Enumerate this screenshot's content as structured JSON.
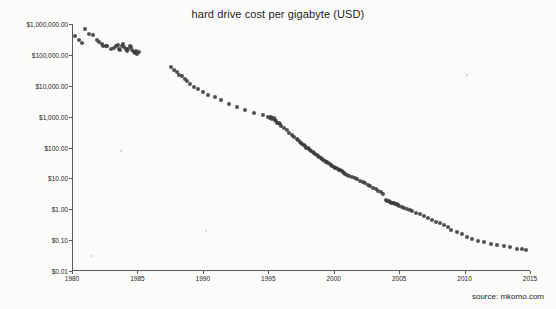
{
  "chart_data": {
    "type": "scatter",
    "title": "hard drive cost per gigabyte (USD)",
    "xlabel": "",
    "ylabel": "",
    "xlim": [
      1980,
      2015
    ],
    "ylim": [
      0.01,
      1000000
    ],
    "yscale": "log",
    "grid": false,
    "legend": null,
    "xticks": [
      1980,
      1985,
      1990,
      1995,
      2000,
      2005,
      2010,
      2015
    ],
    "yticks": [
      0.01,
      0.1,
      1,
      10,
      100,
      1000,
      10000,
      100000,
      1000000
    ],
    "ytick_labels": [
      "$0.01",
      "$0.10",
      "$1.00",
      "$10.00",
      "$100.00",
      "$1,000.00",
      "$10,000.00",
      "$100,000.00",
      "$1,000,000.00"
    ],
    "annotations": [
      {
        "text": "source: mkomo.com",
        "position": "bottom-right"
      }
    ],
    "points": [
      [
        1980.2,
        400000
      ],
      [
        1980.5,
        300000
      ],
      [
        1980.8,
        250000
      ],
      [
        1981.0,
        700000
      ],
      [
        1981.3,
        480000
      ],
      [
        1981.6,
        430000
      ],
      [
        1981.9,
        300000
      ],
      [
        1982.1,
        260000
      ],
      [
        1982.3,
        230000
      ],
      [
        1982.4,
        200000
      ],
      [
        1982.6,
        200000
      ],
      [
        1982.7,
        195000
      ],
      [
        1983.0,
        150000
      ],
      [
        1983.2,
        170000
      ],
      [
        1983.4,
        200000
      ],
      [
        1983.5,
        210000
      ],
      [
        1983.6,
        160000
      ],
      [
        1983.7,
        140000
      ],
      [
        1983.8,
        190000
      ],
      [
        1983.9,
        220000
      ],
      [
        1984.0,
        180000
      ],
      [
        1984.1,
        150000
      ],
      [
        1984.2,
        130000
      ],
      [
        1984.3,
        160000
      ],
      [
        1984.4,
        200000
      ],
      [
        1984.5,
        175000
      ],
      [
        1984.6,
        140000
      ],
      [
        1984.7,
        120000
      ],
      [
        1984.8,
        115000
      ],
      [
        1984.9,
        130000
      ],
      [
        1985.0,
        110000
      ],
      [
        1985.1,
        120000
      ],
      [
        1987.6,
        40000
      ],
      [
        1987.8,
        33000
      ],
      [
        1988.0,
        28000
      ],
      [
        1988.2,
        23000
      ],
      [
        1988.4,
        20000
      ],
      [
        1988.6,
        17000
      ],
      [
        1988.8,
        14000
      ],
      [
        1989.0,
        11000
      ],
      [
        1989.3,
        9000
      ],
      [
        1989.6,
        8000
      ],
      [
        1990.0,
        6500
      ],
      [
        1990.4,
        5000
      ],
      [
        1990.9,
        4200
      ],
      [
        1991.4,
        3400
      ],
      [
        1992.0,
        2600
      ],
      [
        1992.6,
        2000
      ],
      [
        1993.2,
        1700
      ],
      [
        1993.9,
        1300
      ],
      [
        1994.6,
        1100
      ],
      [
        1995.0,
        1000
      ],
      [
        1995.1,
        900
      ],
      [
        1995.2,
        950
      ],
      [
        1995.3,
        830
      ],
      [
        1995.4,
        870
      ],
      [
        1995.5,
        800
      ],
      [
        1995.6,
        700
      ],
      [
        1995.7,
        640
      ],
      [
        1995.8,
        600
      ],
      [
        1995.9,
        560
      ],
      [
        1996.0,
        500
      ],
      [
        1996.2,
        430
      ],
      [
        1996.4,
        360
      ],
      [
        1996.6,
        300
      ],
      [
        1996.8,
        260
      ],
      [
        1997.0,
        220
      ],
      [
        1997.2,
        190
      ],
      [
        1997.3,
        170
      ],
      [
        1997.4,
        150
      ],
      [
        1997.5,
        140
      ],
      [
        1997.6,
        130
      ],
      [
        1997.7,
        120
      ],
      [
        1997.8,
        110
      ],
      [
        1997.9,
        100
      ],
      [
        1998.0,
        95
      ],
      [
        1998.1,
        88
      ],
      [
        1998.2,
        80
      ],
      [
        1998.3,
        75
      ],
      [
        1998.4,
        70
      ],
      [
        1998.5,
        65
      ],
      [
        1998.6,
        60
      ],
      [
        1998.7,
        56
      ],
      [
        1998.8,
        52
      ],
      [
        1998.9,
        48
      ],
      [
        1999.0,
        45
      ],
      [
        1999.1,
        42
      ],
      [
        1999.2,
        40
      ],
      [
        1999.3,
        37
      ],
      [
        1999.4,
        35
      ],
      [
        1999.5,
        33
      ],
      [
        1999.6,
        31
      ],
      [
        1999.7,
        29
      ],
      [
        1999.8,
        27
      ],
      [
        1999.9,
        25
      ],
      [
        2000.0,
        24
      ],
      [
        2000.1,
        22
      ],
      [
        2000.2,
        21
      ],
      [
        2000.3,
        20
      ],
      [
        2000.4,
        19
      ],
      [
        2000.5,
        18
      ],
      [
        2000.6,
        17
      ],
      [
        2000.7,
        16
      ],
      [
        2000.8,
        15
      ],
      [
        2000.9,
        14
      ],
      [
        2001.0,
        13
      ],
      [
        2001.2,
        12
      ],
      [
        2001.4,
        11
      ],
      [
        2001.6,
        10
      ],
      [
        2001.8,
        9.2
      ],
      [
        2002.0,
        8.5
      ],
      [
        2002.2,
        7.8
      ],
      [
        2002.4,
        7.0
      ],
      [
        2002.6,
        6.3
      ],
      [
        2002.8,
        5.6
      ],
      [
        2003.0,
        5.0
      ],
      [
        2003.2,
        4.5
      ],
      [
        2003.4,
        4.0
      ],
      [
        2003.6,
        3.6
      ],
      [
        2003.8,
        3.2
      ],
      [
        2004.0,
        2.0
      ],
      [
        2004.1,
        1.9
      ],
      [
        2004.2,
        1.8
      ],
      [
        2004.3,
        1.7
      ],
      [
        2004.4,
        1.65
      ],
      [
        2004.5,
        1.6
      ],
      [
        2004.6,
        1.55
      ],
      [
        2004.7,
        1.5
      ],
      [
        2004.8,
        1.45
      ],
      [
        2004.9,
        1.4
      ],
      [
        2005.0,
        1.3
      ],
      [
        2005.2,
        1.2
      ],
      [
        2005.4,
        1.1
      ],
      [
        2005.6,
        1.0
      ],
      [
        2005.8,
        0.95
      ],
      [
        2006.0,
        0.85
      ],
      [
        2006.3,
        0.75
      ],
      [
        2006.6,
        0.68
      ],
      [
        2006.9,
        0.6
      ],
      [
        2007.2,
        0.52
      ],
      [
        2007.5,
        0.45
      ],
      [
        2007.8,
        0.4
      ],
      [
        2008.1,
        0.35
      ],
      [
        2008.4,
        0.3
      ],
      [
        2008.7,
        0.26
      ],
      [
        2009.0,
        0.22
      ],
      [
        2009.4,
        0.19
      ],
      [
        2009.8,
        0.16
      ],
      [
        2010.2,
        0.13
      ],
      [
        2010.6,
        0.11
      ],
      [
        2011.0,
        0.095
      ],
      [
        2011.5,
        0.085
      ],
      [
        2012.0,
        0.075
      ],
      [
        2012.5,
        0.07
      ],
      [
        2013.0,
        0.063
      ],
      [
        2013.5,
        0.058
      ],
      [
        2014.0,
        0.052
      ],
      [
        2014.4,
        0.05
      ],
      [
        2014.7,
        0.048
      ]
    ]
  },
  "source": {
    "label": "source: mkomo.com"
  }
}
